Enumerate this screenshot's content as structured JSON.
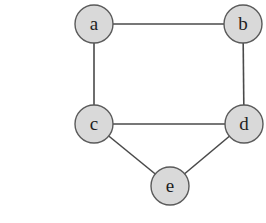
{
  "diagram": {
    "type": "undirected-graph",
    "colors": {
      "node_fill": "#d9d9d9",
      "node_stroke": "#5a5a5a",
      "edge_stroke": "#4a4a4a",
      "label": "#1e1e1e",
      "background": "#ffffff"
    },
    "node_radius": 19,
    "nodes": [
      {
        "id": "a",
        "label": "a",
        "x": 94,
        "y": 24
      },
      {
        "id": "b",
        "label": "b",
        "x": 243,
        "y": 24
      },
      {
        "id": "c",
        "label": "c",
        "x": 94,
        "y": 124
      },
      {
        "id": "d",
        "label": "d",
        "x": 244,
        "y": 124
      },
      {
        "id": "e",
        "label": "e",
        "x": 170,
        "y": 186
      }
    ],
    "edges": [
      {
        "from": "a",
        "to": "b"
      },
      {
        "from": "a",
        "to": "c"
      },
      {
        "from": "b",
        "to": "d"
      },
      {
        "from": "c",
        "to": "d"
      },
      {
        "from": "c",
        "to": "e"
      },
      {
        "from": "d",
        "to": "e"
      }
    ]
  }
}
